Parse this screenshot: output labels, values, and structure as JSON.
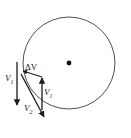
{
  "figure": {
    "type": "vector-diagram",
    "background_color": "#ffffff",
    "stroke_color": "#1a1a1a",
    "circle": {
      "name": "trajectory-circle",
      "center_x": 69,
      "center_y": 63,
      "radius": 46,
      "stroke_width": 0.9,
      "fill": "none"
    },
    "center_point": {
      "name": "circle-center-dot",
      "x": 69,
      "y": 63,
      "radius": 2.4,
      "color": "#111111"
    },
    "vectors": [
      {
        "id": "v1-left",
        "label": "V",
        "subscript": "1",
        "x1": 17,
        "y1": 62,
        "x2": 17,
        "y2": 107,
        "direction": "down",
        "stroke_width": 1.3
      },
      {
        "id": "v2-diagonal",
        "label": "V",
        "subscript": "2",
        "x1": 21,
        "y1": 74,
        "x2": 45,
        "y2": 120,
        "direction": "down-right",
        "stroke_width": 1.3
      },
      {
        "id": "v1-right",
        "label": "V",
        "subscript": "1",
        "x1": 42,
        "y1": 110,
        "x2": 42,
        "y2": 76,
        "direction": "up",
        "stroke_width": 1.3
      },
      {
        "id": "delta-v",
        "label": "ΔV",
        "subscript": "",
        "x1": 42,
        "y1": 76,
        "x2": 22,
        "y2": 70,
        "direction": "up-left",
        "stroke_width": 1.1
      }
    ],
    "labels": [
      {
        "id": "label-v1-left",
        "name": "label-v1-left",
        "text": "V",
        "sub": "1",
        "x": 5,
        "y": 74
      },
      {
        "id": "label-v2",
        "name": "label-v2",
        "text": "V",
        "sub": "2",
        "x": 24,
        "y": 104
      },
      {
        "id": "label-delta-v",
        "name": "label-delta-v",
        "text": "ΔV",
        "sub": "",
        "x": 25,
        "y": 63
      },
      {
        "id": "label-v1-right",
        "name": "label-v1-right",
        "text": "V",
        "sub": "1",
        "x": 44,
        "y": 88
      }
    ]
  }
}
